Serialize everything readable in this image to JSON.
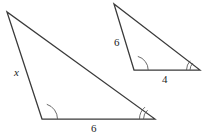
{
  "figure": {
    "type": "geometry-diagram",
    "background_color": "#ffffff",
    "line_color": "#3a3a3a",
    "arc_color": "#5a5a5a",
    "text_color": "#1d1d1d",
    "shapes": [
      {
        "name": "large-triangle",
        "vertices": {
          "apex": [
            7,
            12
          ],
          "bottom_left": [
            42,
            119
          ],
          "bottom_right": [
            155,
            119
          ]
        },
        "angle_marks": [
          {
            "vertex": "bottom_left",
            "ticks": 1
          },
          {
            "vertex": "bottom_right",
            "ticks": 2
          }
        ],
        "side_labels": [
          {
            "name": "left-side-label",
            "text": "x",
            "italic": true,
            "x": 14,
            "y": 67
          },
          {
            "name": "base-label",
            "text": "6",
            "italic": false,
            "x": 91,
            "y": 123
          }
        ]
      },
      {
        "name": "small-triangle",
        "vertices": {
          "apex": [
            114,
            4
          ],
          "bottom_left": [
            134,
            70
          ],
          "bottom_right": [
            200,
            70
          ]
        },
        "angle_marks": [
          {
            "vertex": "bottom_left",
            "ticks": 1
          },
          {
            "vertex": "bottom_right",
            "ticks": 2
          }
        ],
        "side_labels": [
          {
            "name": "left-side-label",
            "text": "6",
            "italic": false,
            "x": 114,
            "y": 37
          },
          {
            "name": "base-label",
            "text": "4",
            "italic": false,
            "x": 162,
            "y": 74
          }
        ]
      }
    ]
  },
  "labels": {
    "large_left": "x",
    "large_base": "6",
    "small_left": "6",
    "small_base": "4"
  }
}
